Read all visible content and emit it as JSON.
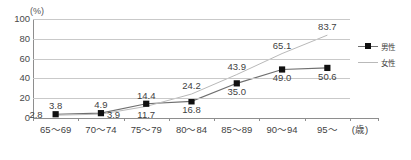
{
  "chart_data": {
    "type": "line",
    "title": "",
    "xlabel": "(歳)",
    "ylabel": "(%)",
    "unit_y": "(%)",
    "unit_x": "(歳)",
    "categories": [
      "65～69",
      "70～74",
      "75～79",
      "80～84",
      "85～89",
      "90～94",
      "95～"
    ],
    "yticks": [
      0,
      20,
      40,
      60,
      80,
      100
    ],
    "ylim": [
      0,
      100
    ],
    "grid": true,
    "legend_position": "right",
    "series": [
      {
        "name": "男性",
        "color": "#6f6f6f",
        "marker": "square",
        "marker_color": "#111111",
        "values": [
          3.8,
          4.9,
          14.4,
          16.8,
          35.0,
          49.0,
          50.6
        ],
        "labels": [
          "3.8",
          "4.9",
          "14.4",
          "16.8",
          "35.0",
          "49.0",
          "50.6"
        ],
        "label_positions": [
          "above",
          "above",
          "above",
          "below",
          "below",
          "below",
          "below"
        ]
      },
      {
        "name": "女性",
        "color": "#b9b9b9",
        "marker": "none",
        "marker_color": "#b9b9b9",
        "values": [
          2.8,
          3.9,
          11.7,
          24.2,
          43.9,
          65.1,
          83.7
        ],
        "labels": [
          "2.8",
          "3.9",
          "11.7",
          "24.2",
          "43.9",
          "65.1",
          "83.7"
        ],
        "label_positions": [
          "left",
          "right",
          "below",
          "above",
          "above",
          "above",
          "above"
        ]
      }
    ]
  },
  "legend": {
    "items": [
      {
        "label": "男性"
      },
      {
        "label": "女性"
      }
    ]
  },
  "colors": {
    "male_line": "#6f6f6f",
    "female_line": "#b9b9b9",
    "marker": "#111111",
    "gridline": "#c9c9c9",
    "axis": "#8e8e8e",
    "text": "#3f3f3f"
  }
}
